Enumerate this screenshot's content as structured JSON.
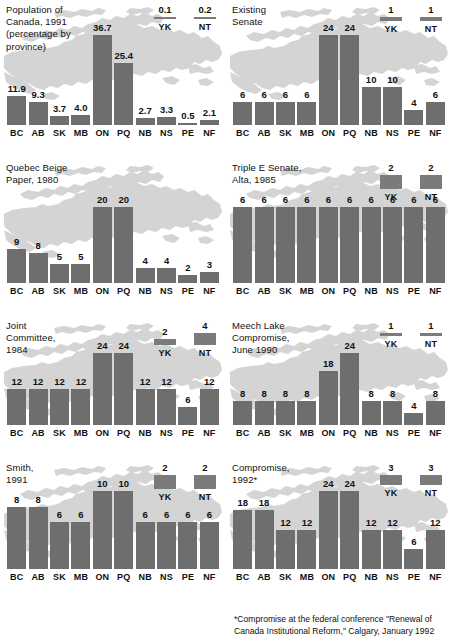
{
  "figure": {
    "panel_count": 8,
    "provinces": [
      "BC",
      "AB",
      "SK",
      "MB",
      "ON",
      "PQ",
      "NB",
      "NS",
      "PE",
      "NF"
    ],
    "territories": [
      "YK",
      "NT"
    ],
    "bar_color": "#6e6e6e",
    "map_color": "#d2d2d2",
    "background_color": "#ffffff"
  },
  "footnote": {
    "text": "*Compromise at the federal conference \"Renewal of\nCanada Institutional Reform,\" Calgary, January 1992"
  },
  "chart_data": [
    {
      "type": "bar",
      "title": "Population of\nCanada, 1991\n(percentage by\nprovince)",
      "categories": [
        "BC",
        "AB",
        "SK",
        "MB",
        "ON",
        "PQ",
        "NB",
        "NS",
        "PE",
        "NF"
      ],
      "values": [
        11.9,
        9.3,
        3.7,
        4.0,
        36.7,
        25.4,
        2.7,
        3.3,
        0.5,
        2.1
      ],
      "labels": [
        "11.9",
        "9.3",
        "3.7",
        "4.0",
        "36.7",
        "25.4",
        "2.7",
        "3.3",
        "0.5",
        "2.1"
      ],
      "territory_categories": [
        "YK",
        "NT"
      ],
      "territory_values": [
        0.1,
        0.2
      ],
      "territory_labels": [
        "0.1",
        "0.2"
      ],
      "ylabel": "",
      "xlabel": "",
      "ylim": [
        0,
        36.7
      ],
      "grid": false
    },
    {
      "type": "bar",
      "title": "Existing\nSenate",
      "categories": [
        "BC",
        "AB",
        "SK",
        "MB",
        "ON",
        "PQ",
        "NB",
        "NS",
        "PE",
        "NF"
      ],
      "values": [
        6,
        6,
        6,
        6,
        24,
        24,
        10,
        10,
        4,
        6
      ],
      "labels": [
        "6",
        "6",
        "6",
        "6",
        "24",
        "24",
        "10",
        "10",
        "4",
        "6"
      ],
      "territory_categories": [
        "YK",
        "NT"
      ],
      "territory_values": [
        1,
        1
      ],
      "territory_labels": [
        "1",
        "1"
      ],
      "ylabel": "",
      "xlabel": "",
      "ylim": [
        0,
        24
      ],
      "grid": false
    },
    {
      "type": "bar",
      "title": "Quebec Beige\nPaper, 1980",
      "categories": [
        "BC",
        "AB",
        "SK",
        "MB",
        "ON",
        "PQ",
        "NB",
        "NS",
        "PE",
        "NF"
      ],
      "values": [
        9,
        8,
        5,
        5,
        20,
        20,
        4,
        4,
        2,
        3
      ],
      "labels": [
        "9",
        "8",
        "5",
        "5",
        "20",
        "20",
        "4",
        "4",
        "2",
        "3"
      ],
      "territory_categories": [],
      "territory_values": [],
      "territory_labels": [],
      "ylabel": "",
      "xlabel": "",
      "ylim": [
        0,
        20
      ],
      "grid": false
    },
    {
      "type": "bar",
      "title": "Triple E Senate,\nAlta, 1985",
      "categories": [
        "BC",
        "AB",
        "SK",
        "MB",
        "ON",
        "PQ",
        "NB",
        "NS",
        "PE",
        "NF"
      ],
      "values": [
        6,
        6,
        6,
        6,
        6,
        6,
        6,
        6,
        6,
        6
      ],
      "labels": [
        "6",
        "6",
        "6",
        "6",
        "6",
        "6",
        "6",
        "6",
        "6",
        "6"
      ],
      "territory_categories": [
        "YK",
        "NT"
      ],
      "territory_values": [
        2,
        2
      ],
      "territory_labels": [
        "2",
        "2"
      ],
      "ylabel": "",
      "xlabel": "",
      "ylim": [
        0,
        6
      ],
      "grid": false
    },
    {
      "type": "bar",
      "title": "Joint\nCommittee,\n1984",
      "categories": [
        "BC",
        "AB",
        "SK",
        "MB",
        "ON",
        "PQ",
        "NB",
        "NS",
        "PE",
        "NF"
      ],
      "values": [
        12,
        12,
        12,
        12,
        24,
        24,
        12,
        12,
        6,
        12
      ],
      "labels": [
        "12",
        "12",
        "12",
        "12",
        "24",
        "24",
        "12",
        "12",
        "6",
        "12"
      ],
      "territory_categories": [
        "YK",
        "NT"
      ],
      "territory_values": [
        2,
        4
      ],
      "territory_labels": [
        "2",
        "4"
      ],
      "ylabel": "",
      "xlabel": "",
      "ylim": [
        0,
        24
      ],
      "grid": false
    },
    {
      "type": "bar",
      "title": "Meech Lake\nCompromise,\nJune 1990",
      "categories": [
        "BC",
        "AB",
        "SK",
        "MB",
        "ON",
        "PQ",
        "NB",
        "NS",
        "PE",
        "NF"
      ],
      "values": [
        8,
        8,
        8,
        8,
        18,
        24,
        8,
        8,
        4,
        8
      ],
      "labels": [
        "8",
        "8",
        "8",
        "8",
        "18",
        "24",
        "8",
        "8",
        "4",
        "8"
      ],
      "territory_categories": [
        "YK",
        "NT"
      ],
      "territory_values": [
        1,
        1
      ],
      "territory_labels": [
        "1",
        "1"
      ],
      "ylabel": "",
      "xlabel": "",
      "ylim": [
        0,
        24
      ],
      "grid": false
    },
    {
      "type": "bar",
      "title": "Smith,\n1991",
      "categories": [
        "BC",
        "AB",
        "SK",
        "MB",
        "ON",
        "PQ",
        "NB",
        "NS",
        "PE",
        "NF"
      ],
      "values": [
        8,
        8,
        6,
        6,
        10,
        10,
        6,
        6,
        6,
        6
      ],
      "labels": [
        "8",
        "8",
        "6",
        "6",
        "10",
        "10",
        "6",
        "6",
        "6",
        "6"
      ],
      "territory_categories": [
        "YK",
        "NT"
      ],
      "territory_values": [
        2,
        2
      ],
      "territory_labels": [
        "2",
        "2"
      ],
      "ylabel": "",
      "xlabel": "",
      "ylim": [
        0,
        10
      ],
      "grid": false
    },
    {
      "type": "bar",
      "title": "Compromise,\n1992*",
      "categories": [
        "BC",
        "AB",
        "SK",
        "MB",
        "ON",
        "PQ",
        "NB",
        "NS",
        "PE",
        "NF"
      ],
      "values": [
        18,
        18,
        12,
        12,
        24,
        24,
        12,
        12,
        6,
        12
      ],
      "labels": [
        "18",
        "18",
        "12",
        "12",
        "24",
        "24",
        "12",
        "12",
        "6",
        "12"
      ],
      "territory_categories": [
        "YK",
        "NT"
      ],
      "territory_values": [
        3,
        3
      ],
      "territory_labels": [
        "3",
        "3"
      ],
      "ylabel": "",
      "xlabel": "",
      "ylim": [
        0,
        24
      ],
      "grid": false
    }
  ]
}
